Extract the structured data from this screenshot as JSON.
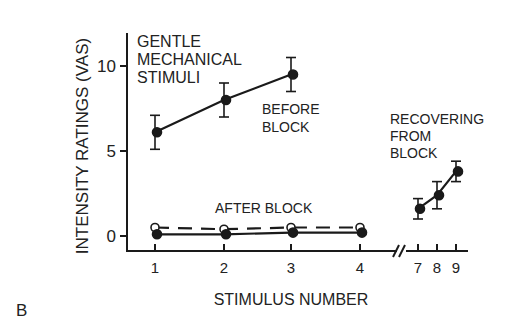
{
  "chart_data": {
    "type": "line",
    "panel_label": "B",
    "title_lines": [
      "GENTLE",
      "MECHANICAL",
      "STIMULI"
    ],
    "xlabel": "STIMULUS NUMBER",
    "ylabel": "INTENSITY RATINGS (VAS)",
    "ylim": [
      0,
      12
    ],
    "y_ticks": [
      0,
      5,
      10
    ],
    "x_ticks": [
      1,
      2,
      3,
      4,
      7,
      8,
      9
    ],
    "axis_break_between": [
      4,
      7
    ],
    "grid": false,
    "legend": "none (inline annotations)",
    "series": [
      {
        "name": "BEFORE BLOCK",
        "label_lines": [
          "BEFORE",
          "BLOCK"
        ],
        "marker": "filled-circle",
        "line": "solid",
        "x": [
          1,
          2,
          3
        ],
        "values": [
          6.1,
          8.0,
          9.5
        ],
        "error": [
          1.0,
          1.0,
          1.0
        ]
      },
      {
        "name": "AFTER BLOCK (open)",
        "label": "AFTER BLOCK",
        "marker": "open-circle",
        "line": "dashed",
        "x": [
          1,
          2,
          3,
          4
        ],
        "values": [
          0.5,
          0.4,
          0.5,
          0.5
        ]
      },
      {
        "name": "AFTER BLOCK (filled)",
        "marker": "filled-circle",
        "line": "solid",
        "x": [
          1,
          2,
          3,
          4
        ],
        "values": [
          0.1,
          0.1,
          0.2,
          0.2
        ]
      },
      {
        "name": "RECOVERING FROM BLOCK",
        "label_lines": [
          "RECOVERING",
          "FROM",
          "BLOCK"
        ],
        "marker": "filled-circle",
        "line": "solid",
        "x": [
          7,
          8,
          9
        ],
        "values": [
          1.6,
          2.4,
          3.8
        ],
        "error": [
          0.6,
          0.8,
          0.6
        ]
      }
    ]
  }
}
